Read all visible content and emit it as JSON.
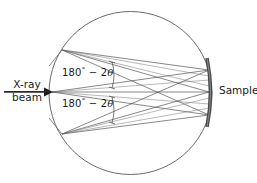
{
  "figure": {
    "type": "optics-geometry-diagram",
    "title_visible": false,
    "background_color": "#ffffff",
    "line_color": "#4a4a4a",
    "text_color": "#1a1a1a",
    "sample_color": "#4a4a4a"
  },
  "labels": {
    "xray_line1": "X-ray",
    "xray_line2": "beam",
    "sample": "Sample",
    "angle_upper": "180",
    "angle_upper_degree": "°",
    "angle_upper_rest": " − 2",
    "angle_upper_theta": "θ",
    "angle_lower": "180",
    "angle_lower_degree": "°",
    "angle_lower_rest": " − 2",
    "angle_lower_theta": "θ"
  },
  "geometry": {
    "focusing_circle": {
      "cx": 130.5,
      "cy": 93,
      "r": 81.5,
      "stroke": "#6b6b6b",
      "stroke_width": 1
    },
    "beam_axis_y": 92,
    "beam_arrow": {
      "x_start": 4,
      "x_end": 52,
      "y": 92
    },
    "source_vertices": [
      {
        "name": "upper-vertex",
        "x": 62,
        "y": 50
      },
      {
        "name": "middle-vertex",
        "x": 52,
        "y": 92
      },
      {
        "name": "lower-vertex",
        "x": 62,
        "y": 134
      }
    ],
    "sample_points": [
      {
        "name": "sample-upper-point",
        "x": 209,
        "y": 70
      },
      {
        "name": "sample-middle-point",
        "x": 209,
        "y": 92
      },
      {
        "name": "sample-lower-point",
        "x": 209,
        "y": 115
      }
    ],
    "sample_bar": {
      "x": 209,
      "y_top": 58,
      "y_bottom": 127,
      "bulge": 5,
      "thickness": 3.4
    },
    "angle_arc_upper": {
      "x": 112,
      "y_top": 62,
      "y_bottom": 88,
      "tick_len": 5
    },
    "angle_arc_lower": {
      "x": 112,
      "y_top": 97,
      "y_bottom": 123,
      "tick_len": 5
    }
  },
  "ray_bundles": [
    {
      "name": "upper-vertex-fan",
      "from": {
        "x": 62,
        "y": 50
      },
      "to": [
        {
          "x": 209,
          "y": 70
        },
        {
          "x": 209,
          "y": 92
        },
        {
          "x": 209,
          "y": 115
        }
      ]
    },
    {
      "name": "middle-vertex-fan",
      "from": {
        "x": 52,
        "y": 92
      },
      "to": [
        {
          "x": 209,
          "y": 70
        },
        {
          "x": 209,
          "y": 92
        },
        {
          "x": 209,
          "y": 115
        }
      ]
    },
    {
      "name": "lower-vertex-fan",
      "from": {
        "x": 62,
        "y": 134
      },
      "to": [
        {
          "x": 209,
          "y": 70
        },
        {
          "x": 209,
          "y": 92
        },
        {
          "x": 209,
          "y": 115
        }
      ]
    }
  ]
}
